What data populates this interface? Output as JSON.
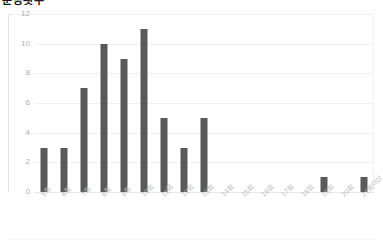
{
  "chart_data": {
    "type": "bar",
    "title": "운동횟수",
    "xlabel": "",
    "ylabel": "",
    "categories": [
      "5회",
      "6회",
      "7회",
      "8회",
      "9회",
      "10회",
      "11회",
      "12회",
      "13회",
      "14회",
      "15회",
      "16회",
      "17회",
      "18회",
      "19회",
      "20회",
      "21회이상"
    ],
    "values": [
      3,
      3,
      7,
      10,
      9,
      11,
      5,
      3,
      5,
      0,
      0,
      0,
      0,
      0,
      1,
      0,
      1
    ],
    "ylim": [
      0,
      12
    ],
    "yticks": [
      0,
      2,
      4,
      6,
      8,
      10,
      12
    ],
    "ytick_labels": [
      "0",
      "2",
      "4",
      "6",
      "8",
      "10",
      "12"
    ],
    "grid": true,
    "legend": false,
    "bar_color": "#595959",
    "grid_color": "#f0f0f0",
    "axis_label_color": "#bdbdbd",
    "background": "#ffffff"
  }
}
